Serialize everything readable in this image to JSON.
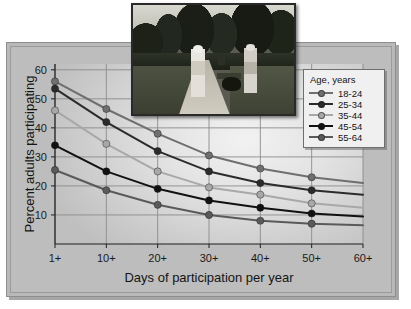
{
  "chart_data": {
    "type": "line",
    "title": "",
    "xlabel": "Days of participation per year",
    "ylabel": "Percent adults participating",
    "categories": [
      "1+",
      "10+",
      "20+",
      "30+",
      "40+",
      "50+",
      "60+"
    ],
    "ylim": [
      0,
      62
    ],
    "yticks": [
      10,
      20,
      30,
      40,
      50,
      60
    ],
    "grid": true,
    "legend_position": "top-right",
    "legend_title": "Age, years",
    "series": [
      {
        "name": "18-24",
        "color": "#6f6f6f",
        "values": [
          56,
          46.5,
          38,
          30.5,
          26,
          23,
          21
        ]
      },
      {
        "name": "25-34",
        "color": "#2b2b2b",
        "values": [
          53.5,
          42,
          32,
          25,
          21,
          18.5,
          17
        ]
      },
      {
        "name": "35-44",
        "color": "#a8a8a8",
        "values": [
          46,
          34.5,
          25,
          19.5,
          17,
          14,
          12.5
        ]
      },
      {
        "name": "45-54",
        "color": "#111111",
        "values": [
          34,
          25,
          19,
          15,
          12.5,
          10.5,
          9.5
        ]
      },
      {
        "name": "55-64",
        "color": "#5a5a5a",
        "values": [
          25.5,
          18.5,
          13.5,
          10,
          8,
          7,
          6.5
        ]
      }
    ],
    "markers_last_point": false
  },
  "legend": {
    "title": "Age, years",
    "items": [
      {
        "label": "18-24",
        "color": "#6f6f6f"
      },
      {
        "label": "25-34",
        "color": "#2b2b2b"
      },
      {
        "label": "35-44",
        "color": "#a8a8a8"
      },
      {
        "label": "45-54",
        "color": "#111111"
      },
      {
        "label": "55-64",
        "color": "#5a5a5a"
      }
    ]
  },
  "photo": {
    "alt": "Two adults walking a dog on a paved park path lined with hedges and trees"
  },
  "colors": {
    "plate": "#bdbdbd",
    "plot_light": "#f2f2f2",
    "plot_dark": "#bfbfbf",
    "axis": "#1f1f1f",
    "grid": "#8b8b8b",
    "legend_bg": "#f0f0f0"
  }
}
